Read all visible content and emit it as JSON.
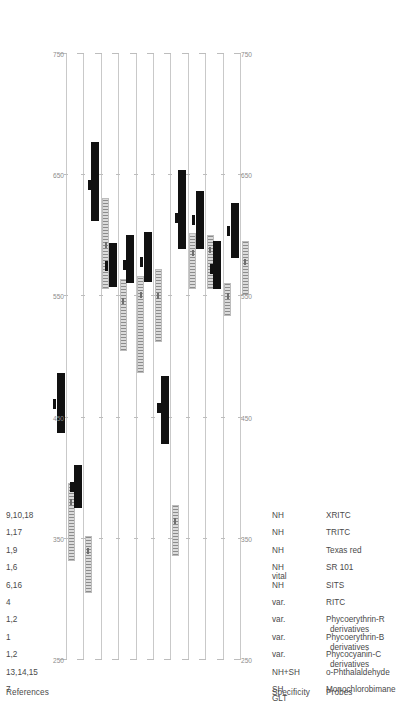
{
  "figure": {
    "orientation": "rotated-90-ccw",
    "columns": {
      "probes_header": "Probes",
      "specificity_header": "Specificity",
      "references_header": "References"
    }
  },
  "axis": {
    "label": "",
    "ticks": [
      250,
      350,
      450,
      550,
      650,
      750
    ],
    "tick_labels": [
      "250",
      "350",
      "450",
      "550",
      "650",
      "750"
    ],
    "min": 250,
    "max": 750,
    "unit": "nm",
    "colors": {
      "emission": "#111111",
      "excitation": "#9a9a9a",
      "axis": "#c9c9c9",
      "text": "#4a4a4a"
    }
  },
  "rows": [
    {
      "probe": "Monochlorobimane",
      "probe_line2": "",
      "specificity": "SH",
      "specificity_line2": "GLT",
      "references": "7",
      "excitation_range": [
        332,
        396
      ],
      "excitation_peak": 380,
      "emission_range": [
        437,
        487
      ],
      "emission_peak": 461
    },
    {
      "probe": "o-Phthalaldehyde",
      "probe_line2": "",
      "specificity": "NH+SH",
      "specificity_line2": "",
      "references": "13,14,15",
      "excitation_range": [
        305,
        352
      ],
      "excitation_peak": 340,
      "emission_range": [
        375,
        411
      ],
      "emission_peak": 393
    },
    {
      "probe": "Phycocyanin-C",
      "probe_line2": "derivatives",
      "specificity": "var.",
      "specificity_line2": "",
      "references": "1,2",
      "excitation_range": [
        556,
        631
      ],
      "excitation_peak": 592,
      "emission_range": [
        612,
        677
      ],
      "emission_peak": 642
    },
    {
      "probe": "Phycoerythrin-B",
      "probe_line2": "derivatives",
      "specificity": "var.",
      "specificity_line2": "",
      "references": "1",
      "excitation_range": [
        505,
        564
      ],
      "excitation_peak": 546,
      "emission_range": [
        558,
        594
      ],
      "emission_peak": 575
    },
    {
      "probe": "Phycoerythrin-R",
      "probe_line2": "derivatives",
      "specificity": "var.",
      "specificity_line2": "",
      "references": "1,2",
      "excitation_range": [
        487,
        567
      ],
      "excitation_peak": 551,
      "emission_range": [
        561,
        601
      ],
      "emission_peak": 576
    },
    {
      "probe": "RITC",
      "probe_line2": "",
      "specificity": "var.",
      "specificity_line2": "",
      "references": "4",
      "excitation_range": [
        512,
        573
      ],
      "excitation_peak": 550,
      "emission_range": [
        562,
        603
      ],
      "emission_peak": 578
    },
    {
      "probe": "SITS",
      "probe_line2": "",
      "specificity": "NH",
      "specificity_line2": "",
      "references": "6,16",
      "excitation_range": [
        336,
        378
      ],
      "excitation_peak": 365,
      "emission_range": [
        428,
        484
      ],
      "emission_peak": 458
    },
    {
      "probe": "SR 101",
      "probe_line2": "",
      "specificity": "NH",
      "specificity_line2": "vital",
      "references": "1,6",
      "excitation_range": [
        556,
        602
      ],
      "excitation_peak": 586,
      "emission_range": [
        589,
        654
      ],
      "emission_peak": 615
    },
    {
      "probe": "Texas red",
      "probe_line2": "",
      "specificity": "NH",
      "specificity_line2": "",
      "references": "1,9",
      "excitation_range": [
        556,
        601
      ],
      "excitation_peak": 588,
      "emission_range": [
        589,
        637
      ],
      "emission_peak": 613
    },
    {
      "probe": "TRITC",
      "probe_line2": "",
      "specificity": "NH",
      "specificity_line2": "",
      "references": "1,17",
      "excitation_range": [
        534,
        561
      ],
      "excitation_peak": 550,
      "emission_range": [
        556,
        596
      ],
      "emission_peak": 573
    },
    {
      "probe": "XRITC",
      "probe_line2": "",
      "specificity": "NH",
      "specificity_line2": "",
      "references": "9,10,18",
      "excitation_range": [
        551,
        596
      ],
      "excitation_peak": 578,
      "emission_range": [
        582,
        627
      ],
      "emission_peak": 604
    }
  ],
  "chart_data": {
    "type": "bar",
    "title": "",
    "xlabel": "Wavelength (nm)",
    "ylabel": "",
    "xlim": [
      250,
      750
    ],
    "grid": false,
    "legend": [
      "excitation range (grey)",
      "emission range (black)"
    ],
    "categories": [
      "Monochlorobimane",
      "o-Phthalaldehyde",
      "Phycocyanin-C derivatives",
      "Phycoerythrin-B derivatives",
      "Phycoerythrin-R derivatives",
      "RITC",
      "SITS",
      "SR 101",
      "Texas red",
      "TRITC",
      "XRITC"
    ],
    "series": [
      {
        "name": "excitation range",
        "ranges": [
          [
            332,
            396
          ],
          [
            305,
            352
          ],
          [
            556,
            631
          ],
          [
            505,
            564
          ],
          [
            487,
            567
          ],
          [
            512,
            573
          ],
          [
            336,
            378
          ],
          [
            556,
            602
          ],
          [
            556,
            601
          ],
          [
            534,
            561
          ],
          [
            551,
            596
          ]
        ],
        "peaks": [
          380,
          340,
          592,
          546,
          551,
          550,
          365,
          586,
          588,
          550,
          578
        ]
      },
      {
        "name": "emission range",
        "ranges": [
          [
            437,
            487
          ],
          [
            375,
            411
          ],
          [
            612,
            677
          ],
          [
            558,
            594
          ],
          [
            561,
            601
          ],
          [
            562,
            603
          ],
          [
            428,
            484
          ],
          [
            589,
            654
          ],
          [
            589,
            637
          ],
          [
            556,
            596
          ],
          [
            582,
            627
          ]
        ],
        "peaks": [
          461,
          393,
          642,
          575,
          576,
          578,
          458,
          615,
          613,
          573,
          604
        ]
      }
    ]
  }
}
